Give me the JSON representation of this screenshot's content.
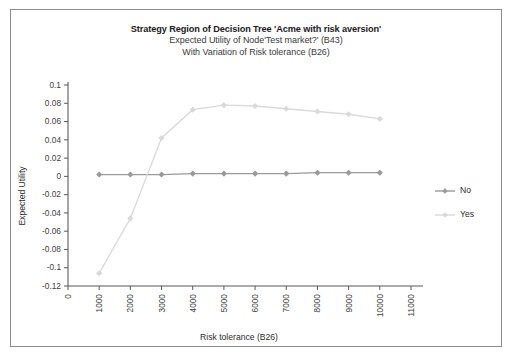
{
  "chart_data": {
    "type": "line",
    "title": "Strategy Region of Decision Tree 'Acme with risk aversion'",
    "subtitle": "Expected Utility of Node'Test market?' (B43)",
    "subtitle2": "With Variation of Risk tolerance (B26)",
    "xlabel": "Risk tolerance (B26)",
    "ylabel": "Expected Utility",
    "x": [
      1000,
      2000,
      3000,
      4000,
      5000,
      6000,
      7000,
      8000,
      9000,
      10000
    ],
    "xlim": [
      0,
      11000
    ],
    "ylim": [
      -0.12,
      0.1
    ],
    "xticks": [
      "0",
      "1000",
      "2000",
      "3000",
      "4000",
      "5000",
      "6000",
      "7000",
      "8000",
      "9000",
      "10000",
      "11000"
    ],
    "yticks": [
      "0.1",
      "0.08",
      "0.06",
      "0.04",
      "0.02",
      "0",
      "-0.02",
      "-0.04",
      "-0.06",
      "-0.08",
      "-0.1",
      "-0.12"
    ],
    "grid": false,
    "legend_position": "right",
    "series": [
      {
        "name": "No",
        "color": "#9a9a9a",
        "values": [
          0.002,
          0.002,
          0.002,
          0.003,
          0.003,
          0.003,
          0.003,
          0.004,
          0.004,
          0.004
        ]
      },
      {
        "name": "Yes",
        "color": "#d9d9d9",
        "values": [
          -0.106,
          -0.046,
          0.042,
          0.073,
          0.078,
          0.077,
          0.074,
          0.071,
          0.068,
          0.063
        ]
      }
    ]
  },
  "legend": {
    "items": [
      {
        "label": "No"
      },
      {
        "label": "Yes"
      }
    ]
  }
}
